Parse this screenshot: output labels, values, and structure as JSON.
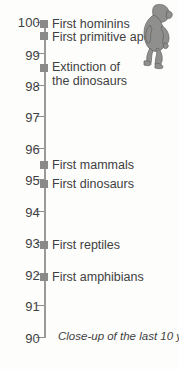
{
  "chart_data": {
    "type": "scatter",
    "title": "",
    "subtitle": "",
    "xlabel": "",
    "ylabel": "",
    "orientation": "vertical-timeline",
    "grid": false,
    "legend": null,
    "axis": {
      "ylim": [
        90,
        100
      ],
      "ticks": [
        100,
        99,
        98,
        97,
        96,
        95,
        94,
        93,
        92,
        91,
        90
      ],
      "tick_labels": [
        "100",
        "99",
        "98",
        "97",
        "96",
        "95",
        "94",
        "93",
        "92",
        "91",
        "90"
      ],
      "direction": "descending",
      "units": "yards"
    },
    "events": [
      {
        "label": "First hominins",
        "value": 100.0
      },
      {
        "label": "First primitive apes",
        "value": 99.7
      },
      {
        "label": "Extinction of\nthe dinosaurs",
        "value": 98.6
      },
      {
        "label": "First mammals",
        "value": 95.6
      },
      {
        "label": "First dinosaurs",
        "value": 95.0
      },
      {
        "label": "First reptiles",
        "value": 93.1
      },
      {
        "label": "First amphibians",
        "value": 92.1
      }
    ],
    "annotations": [
      {
        "name": "caption",
        "text": "Close-up of the last 10 yards"
      }
    ],
    "colors": {
      "axis": "#9a9a98",
      "marker": "#8a8a88",
      "text": "#3f3f3f",
      "background": "#fdfdfc",
      "illustration": "#8f8f8d"
    }
  },
  "axis": {
    "ticks": [
      {
        "label": "100",
        "top": 15,
        "tick_top": 22
      },
      {
        "label": "99",
        "top": 48,
        "tick_top": 53
      },
      {
        "label": "98",
        "top": 79,
        "tick_top": 85
      },
      {
        "label": "97",
        "top": 110,
        "tick_top": 116
      },
      {
        "label": "96",
        "top": 142,
        "tick_top": 148
      },
      {
        "label": "95",
        "top": 173,
        "tick_top": 179
      },
      {
        "label": "94",
        "top": 205,
        "tick_top": 211
      },
      {
        "label": "93",
        "top": 236,
        "tick_top": 242
      },
      {
        "label": "92",
        "top": 268,
        "tick_top": 274
      },
      {
        "label": "91",
        "top": 299,
        "tick_top": 305
      },
      {
        "label": "90",
        "top": 331,
        "tick_top": 337
      }
    ]
  },
  "events": [
    {
      "label": "First hominins",
      "marker_top": 20,
      "label_top": 17
    },
    {
      "label": "First primitive apes",
      "marker_top": 32,
      "label_top": 30
    },
    {
      "label": "Extinction of\nthe dinosaurs",
      "marker_top": 64,
      "label_top": 60
    },
    {
      "label": "First mammals",
      "marker_top": 161,
      "label_top": 158
    },
    {
      "label": "First dinosaurs",
      "marker_top": 180,
      "label_top": 177
    },
    {
      "label": "First reptiles",
      "marker_top": 241,
      "label_top": 238
    },
    {
      "label": "First amphibians",
      "marker_top": 273,
      "label_top": 270
    }
  ],
  "caption": {
    "text": "Close-up of the last 10 yards"
  },
  "illustration": {
    "name": "walking-ape",
    "alt": "walking ape figure"
  }
}
